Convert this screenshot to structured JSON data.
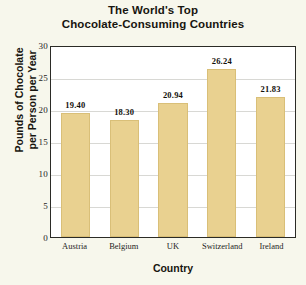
{
  "chart_data": {
    "type": "bar",
    "title": "The World's Top Chocolate-Consuming Countries",
    "title_lines": [
      "The World's Top",
      "Chocolate-Consuming Countries"
    ],
    "categories": [
      "Austria",
      "Belgium",
      "UK",
      "Switzerland",
      "Ireland"
    ],
    "values": [
      19.4,
      18.3,
      20.94,
      26.24,
      21.83
    ],
    "value_labels": [
      "19.40",
      "18.30",
      "20.94",
      "26.24",
      "21.83"
    ],
    "xlabel": "Country",
    "ylabel": "Pounds of Chocolate per Person per Year",
    "ylabel_lines": [
      "Pounds of Chocolate",
      "per Person per Year"
    ],
    "ylim": [
      0,
      30
    ],
    "ytick_values": [
      0,
      5,
      10,
      15,
      20,
      25,
      30
    ],
    "ytick_labels": [
      "0",
      "5",
      "10",
      "15",
      "20",
      "25",
      "30"
    ],
    "grid": true,
    "legend": false,
    "bar_color": "#e9d190",
    "bar_edge_color": "#d9bf78",
    "plot_background": "#ffffff",
    "figure_background": "#f7f7ec",
    "axis_color": "#2b2b26",
    "grid_color": "#d8d8d4",
    "text_color": "#17150f"
  }
}
